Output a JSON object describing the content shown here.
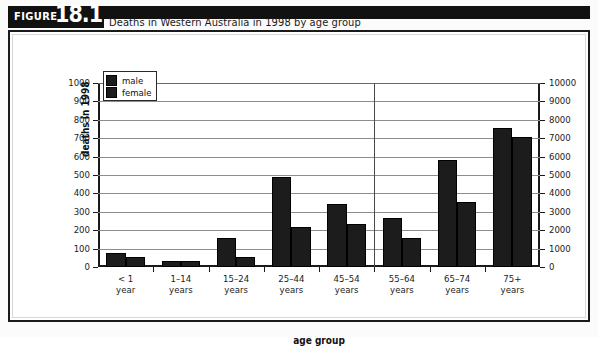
{
  "figure": {
    "tag_word": "FIGURE",
    "number": "18.1",
    "title": "Deaths in Western Australia in 1998 by age group"
  },
  "legend": {
    "position": "top-left",
    "items": [
      {
        "label": "male",
        "color": "#1c1c1c"
      },
      {
        "label": "female",
        "color": "#1c1c1c"
      }
    ]
  },
  "axes": {
    "left_title": "deaths in 1998",
    "x_title": "age group",
    "left_ticks": [
      "1000",
      "900",
      "800",
      "700",
      "600",
      "500",
      "400",
      "300",
      "200",
      "100",
      "0"
    ],
    "right_ticks": [
      "10000",
      "9000",
      "8000",
      "7000",
      "6000",
      "5000",
      "4000",
      "3000",
      "2000",
      "1000",
      "0"
    ]
  },
  "chart_data": {
    "type": "bar",
    "title": "Deaths in Western Australia in 1998 by age group",
    "xlabel": "age group",
    "ylabel": "deaths in 1998",
    "ylabel_right": "deaths in 1998",
    "ylim": [
      0,
      1000
    ],
    "ylim_right": [
      0,
      10000
    ],
    "grid": true,
    "legend_position": "top-left",
    "categories": [
      "< 1 year",
      "1–14 years",
      "15–24 years",
      "25–44 years",
      "45–54 years",
      "55–64 years",
      "65–74 years",
      "75+ years"
    ],
    "series": [
      {
        "name": "male",
        "values": [
          75,
          35,
          155,
          490,
          345,
          265,
          580,
          755
        ]
      },
      {
        "name": "female",
        "values": [
          55,
          35,
          55,
          215,
          235,
          155,
          355,
          705
        ]
      }
    ],
    "annotations": [
      {
        "type": "vertical-divider",
        "after_category": "45–54 years"
      }
    ]
  }
}
